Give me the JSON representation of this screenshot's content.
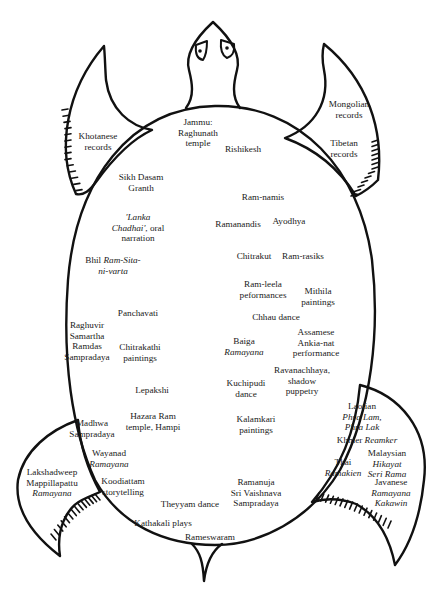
{
  "figure": {
    "type": "turtle-map-diagram",
    "stroke_color": "#111111",
    "background": "#ffffff"
  },
  "regions": {
    "head": [],
    "left_front_flipper": [
      {
        "id": "khotanese",
        "lines": [
          {
            "t": "Khotanese"
          },
          {
            "t": "records"
          }
        ],
        "x": 98,
        "y": 136
      }
    ],
    "right_front_flipper": [
      {
        "id": "mongolian",
        "lines": [
          {
            "t": "Mongolian"
          },
          {
            "t": "records"
          }
        ],
        "x": 349,
        "y": 104
      },
      {
        "id": "tibetan",
        "lines": [
          {
            "t": "Tibetan"
          },
          {
            "t": "records"
          }
        ],
        "x": 344,
        "y": 143
      }
    ],
    "left_rear_flipper": [
      {
        "id": "lakshadweep",
        "lines": [
          {
            "t": "Lakshadweep"
          },
          {
            "t": "Mappillapattu"
          },
          {
            "t": "Ramayana",
            "i": true
          }
        ],
        "x": 52,
        "y": 472
      }
    ],
    "right_rear_flipper": [
      {
        "id": "laotian",
        "lines": [
          {
            "t": "Laotian"
          },
          {
            "t": "Phra Lam,",
            "i": true
          },
          {
            "t": "Phra Lak",
            "i": true
          }
        ],
        "x": 362,
        "y": 406
      },
      {
        "id": "khmer",
        "lines": [
          {
            "t": "Khmer "
          },
          {
            "t": "Reamker",
            "i": true,
            "inline": true
          }
        ],
        "x": 367,
        "y": 440,
        "inline": true
      },
      {
        "id": "thai",
        "lines": [
          {
            "t": "Thai"
          },
          {
            "t": "Ramakien",
            "i": true
          }
        ],
        "x": 343,
        "y": 462
      },
      {
        "id": "malaysian",
        "lines": [
          {
            "t": "Malaysian"
          },
          {
            "t": "Hikayat",
            "i": true
          },
          {
            "t": "Seri Rama",
            "i": true
          }
        ],
        "x": 387,
        "y": 453
      },
      {
        "id": "javanese",
        "lines": [
          {
            "t": "Javanese"
          },
          {
            "t": "Ramayana",
            "i": true
          },
          {
            "t": "Kakawin",
            "i": true
          }
        ],
        "x": 391,
        "y": 482
      }
    ],
    "shell": [
      {
        "id": "jammu",
        "lines": [
          {
            "t": "Jammu:"
          },
          {
            "t": "Raghunath"
          },
          {
            "t": "temple"
          }
        ],
        "x": 198,
        "y": 122
      },
      {
        "id": "rishikesh",
        "lines": [
          {
            "t": "Rishikesh"
          }
        ],
        "x": 243,
        "y": 149
      },
      {
        "id": "sikh",
        "lines": [
          {
            "t": "Sikh Dasam"
          },
          {
            "t": "Granth"
          }
        ],
        "x": 141,
        "y": 177
      },
      {
        "id": "ramnamis",
        "lines": [
          {
            "t": "Ram-namis"
          }
        ],
        "x": 263,
        "y": 197
      },
      {
        "id": "lanka",
        "lines": [
          {
            "t": "'Lanka",
            "i": true
          },
          {
            "t": "Chadhai', oral",
            "mixed": true
          },
          {
            "t": "narration"
          }
        ],
        "x": 138,
        "y": 217
      },
      {
        "id": "ramanandis",
        "lines": [
          {
            "t": "Ramanandis"
          }
        ],
        "x": 238,
        "y": 224
      },
      {
        "id": "ayodhya",
        "lines": [
          {
            "t": "Ayodhya"
          }
        ],
        "x": 289,
        "y": 221
      },
      {
        "id": "bhil",
        "lines": [
          {
            "t": "Bhil "
          },
          {
            "t": "Ram-Sita-",
            "i": true
          },
          {
            "t": "ni-varta",
            "i": true
          }
        ],
        "x": 113,
        "y": 260,
        "bhil": true
      },
      {
        "id": "chitrakut",
        "lines": [
          {
            "t": "Chitrakut"
          }
        ],
        "x": 254,
        "y": 256
      },
      {
        "id": "ramrasiks",
        "lines": [
          {
            "t": "Ram-rasiks"
          }
        ],
        "x": 303,
        "y": 256
      },
      {
        "id": "ramleela",
        "lines": [
          {
            "t": "Ram-leela"
          },
          {
            "t": "peformances"
          }
        ],
        "x": 263,
        "y": 284
      },
      {
        "id": "mithila",
        "lines": [
          {
            "t": "Mithila"
          },
          {
            "t": "paintings"
          }
        ],
        "x": 318,
        "y": 291
      },
      {
        "id": "panchavati",
        "lines": [
          {
            "t": "Panchavati"
          }
        ],
        "x": 138,
        "y": 313
      },
      {
        "id": "chhau",
        "lines": [
          {
            "t": "Chhau dance"
          }
        ],
        "x": 276,
        "y": 317
      },
      {
        "id": "raghuvir",
        "lines": [
          {
            "t": "Raghuvir"
          },
          {
            "t": "Samartha"
          },
          {
            "t": "Ramdas"
          },
          {
            "t": "Sampradaya"
          }
        ],
        "x": 87,
        "y": 325
      },
      {
        "id": "assamese",
        "lines": [
          {
            "t": "Assamese"
          },
          {
            "t": "Ankia-nat"
          },
          {
            "t": "performance"
          }
        ],
        "x": 316,
        "y": 332
      },
      {
        "id": "chitrakathi",
        "lines": [
          {
            "t": "Chitrakathi"
          },
          {
            "t": "paintings"
          }
        ],
        "x": 140,
        "y": 347
      },
      {
        "id": "baiga",
        "lines": [
          {
            "t": "Baiga"
          },
          {
            "t": "Ramayana",
            "i": true
          }
        ],
        "x": 244,
        "y": 341
      },
      {
        "id": "ravanachhaya",
        "lines": [
          {
            "t": "Ravanachhaya,"
          },
          {
            "t": "shadow"
          },
          {
            "t": "puppetry"
          }
        ],
        "x": 302,
        "y": 370
      },
      {
        "id": "kuchipudi",
        "lines": [
          {
            "t": "Kuchipudi"
          },
          {
            "t": "dance"
          }
        ],
        "x": 246,
        "y": 383
      },
      {
        "id": "lepakshi",
        "lines": [
          {
            "t": "Lepakshi"
          }
        ],
        "x": 152,
        "y": 390
      },
      {
        "id": "kalamkari",
        "lines": [
          {
            "t": "Kalamkari"
          },
          {
            "t": "paintings"
          }
        ],
        "x": 256,
        "y": 419
      },
      {
        "id": "hazara",
        "lines": [
          {
            "t": "Hazara Ram"
          },
          {
            "t": "temple, Hampi"
          }
        ],
        "x": 153,
        "y": 416
      },
      {
        "id": "madhwa",
        "lines": [
          {
            "t": "Madhwa"
          },
          {
            "t": "Sampradaya"
          }
        ],
        "x": 92,
        "y": 423
      },
      {
        "id": "wayanad",
        "lines": [
          {
            "t": "Wayanad"
          },
          {
            "t": "Ramayana",
            "i": true
          }
        ],
        "x": 109,
        "y": 453
      },
      {
        "id": "koodiattam",
        "lines": [
          {
            "t": "Koodiattam"
          },
          {
            "t": "storytelling"
          }
        ],
        "x": 123,
        "y": 481
      },
      {
        "id": "ramanuja",
        "lines": [
          {
            "t": "Ramanuja"
          },
          {
            "t": "Sri Vaishnava"
          },
          {
            "t": "Sampradaya"
          }
        ],
        "x": 256,
        "y": 482
      },
      {
        "id": "theyyam",
        "lines": [
          {
            "t": "Theyyam dance"
          }
        ],
        "x": 190,
        "y": 504
      },
      {
        "id": "kathakali",
        "lines": [
          {
            "t": "Kathakali plays"
          }
        ],
        "x": 163,
        "y": 523
      },
      {
        "id": "rameswaram",
        "lines": [
          {
            "t": "Rameswaram"
          }
        ],
        "x": 210,
        "y": 537
      }
    ]
  }
}
